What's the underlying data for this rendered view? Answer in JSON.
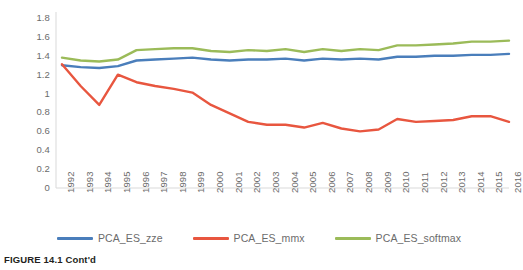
{
  "caption": "FIGURE 14.1  Cont'd",
  "legend": {
    "position": "bottom",
    "entries": [
      {
        "label": "PCA_ES_zze",
        "color": "#4A7EBB"
      },
      {
        "label": "PCA_ES_mmx",
        "color": "#E8563F"
      },
      {
        "label": "PCA_ES_softmax",
        "color": "#9BBB59"
      }
    ]
  },
  "chart_data": {
    "type": "line",
    "title": "",
    "subtitle": "",
    "xlabel": "",
    "ylabel": "",
    "grid": false,
    "legend_position": "bottom",
    "ylim": [
      0,
      1.8
    ],
    "yticks": [
      "0",
      "0.2",
      "0.4",
      "0.6",
      "0.8",
      "1",
      "1.2",
      "1.4",
      "1.6",
      "1.8"
    ],
    "ytick_values": [
      0,
      0.2,
      0.4,
      0.6,
      0.8,
      1.0,
      1.2,
      1.4,
      1.6,
      1.8
    ],
    "categories": [
      "1992",
      "1993",
      "1994",
      "1995",
      "1996",
      "1997",
      "1998",
      "1999",
      "2000",
      "2001",
      "2002",
      "2003",
      "2004",
      "2005",
      "2006",
      "2007",
      "2008",
      "2009",
      "2010",
      "2011",
      "2012",
      "2013",
      "2014",
      "2015",
      "2016"
    ],
    "series": [
      {
        "name": "PCA_ES_zze",
        "color": "#4A7EBB",
        "values": [
          1.3,
          1.28,
          1.27,
          1.29,
          1.35,
          1.36,
          1.37,
          1.38,
          1.36,
          1.35,
          1.36,
          1.36,
          1.37,
          1.35,
          1.37,
          1.36,
          1.37,
          1.36,
          1.39,
          1.39,
          1.4,
          1.4,
          1.41,
          1.41,
          1.42
        ]
      },
      {
        "name": "PCA_ES_mmx",
        "color": "#E8563F",
        "values": [
          1.31,
          1.08,
          0.88,
          1.2,
          1.12,
          1.08,
          1.05,
          1.01,
          0.88,
          0.79,
          0.7,
          0.67,
          0.67,
          0.64,
          0.69,
          0.63,
          0.6,
          0.62,
          0.73,
          0.7,
          0.71,
          0.72,
          0.76,
          0.76,
          0.7
        ]
      },
      {
        "name": "PCA_ES_softmax",
        "color": "#9BBB59",
        "values": [
          1.38,
          1.35,
          1.34,
          1.36,
          1.46,
          1.47,
          1.48,
          1.48,
          1.45,
          1.44,
          1.46,
          1.45,
          1.47,
          1.44,
          1.47,
          1.45,
          1.47,
          1.46,
          1.51,
          1.51,
          1.52,
          1.53,
          1.55,
          1.55,
          1.56
        ]
      }
    ]
  }
}
